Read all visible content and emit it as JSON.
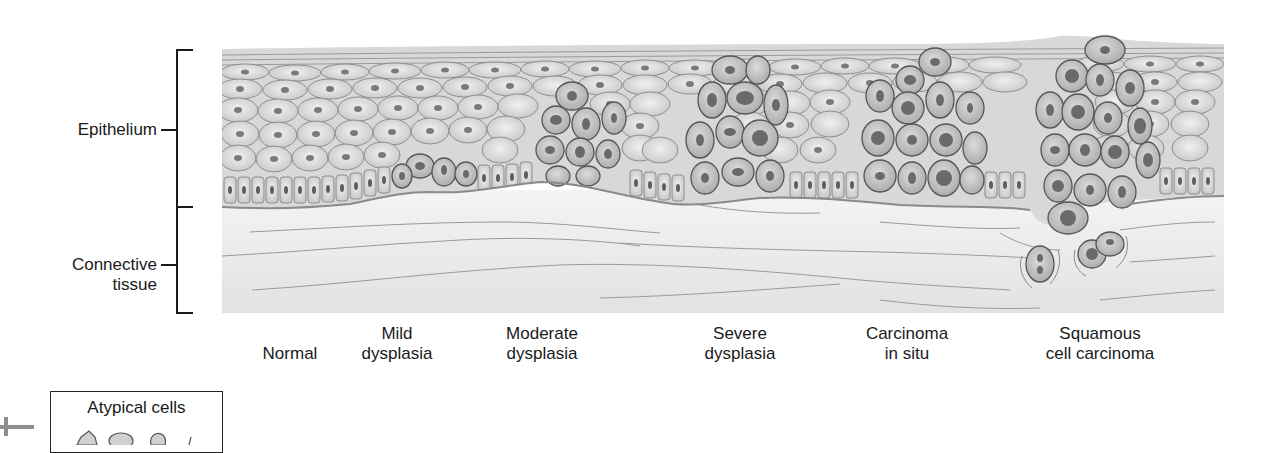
{
  "figure": {
    "layers": [
      {
        "id": "epithelium",
        "label_lines": [
          "Epithelium"
        ]
      },
      {
        "id": "connective",
        "label_lines": [
          "Connective",
          "tissue"
        ]
      }
    ],
    "stages": [
      {
        "id": "normal",
        "lines": [
          "",
          "Normal"
        ]
      },
      {
        "id": "mild",
        "lines": [
          "Mild",
          "dysplasia"
        ]
      },
      {
        "id": "moderate",
        "lines": [
          "Moderate",
          "dysplasia"
        ]
      },
      {
        "id": "severe",
        "lines": [
          "Severe",
          "dysplasia"
        ]
      },
      {
        "id": "cis",
        "lines": [
          "Carcinoma",
          "in situ"
        ]
      },
      {
        "id": "scc",
        "lines": [
          "Squamous",
          "cell carcinoma"
        ]
      }
    ],
    "legend": {
      "title": "Atypical cells"
    },
    "colors": {
      "epithelium_fill": "#d9d9d9",
      "cell_outline": "#8a8a8a",
      "atypical_outline": "#5a5a5a",
      "atypical_fill": "#bfbfbf",
      "nucleus": "#6e6e6e",
      "connective_fill": "#ececec",
      "fiber": "#9a9a9a",
      "bracket": "#1a1a1a"
    }
  }
}
